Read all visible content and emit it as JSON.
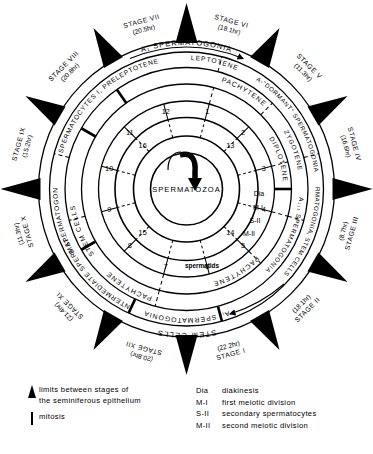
{
  "diagram": {
    "title_text": "Cycle of the seminiferous epithelium",
    "center_label": "SPERMATOZOA",
    "stages": [
      {
        "name": "STAGE I",
        "duration": "(22.2hr)"
      },
      {
        "name": "STAGE II",
        "duration": "(18.1hr)"
      },
      {
        "name": "STAGE III",
        "duration": "(8.7hr)"
      },
      {
        "name": "STAGE IV",
        "duration": "(16.6hr)"
      },
      {
        "name": "STAGE V",
        "duration": "(11.3hr)"
      },
      {
        "name": "STAGE VI",
        "duration": "(18.1hr)"
      },
      {
        "name": "STAGE VII",
        "duration": "(20.5hr)"
      },
      {
        "name": "STAGE VIII",
        "duration": "(20.8hr)"
      },
      {
        "name": "STAGE IX",
        "duration": "(15.2hr)"
      },
      {
        "name": "STAGE X",
        "duration": "(11.3hr)"
      },
      {
        "name": "STAGE XI",
        "duration": "(21.4hr)"
      },
      {
        "name": "STAGE XII",
        "duration": "(20.8hr)"
      }
    ],
    "ring_labels": {
      "outer": [
        "STEM CELLS",
        "A₁ SPERMATOGONIA"
      ],
      "second": [
        "Aᵢᵥ SPERMATOGONIA",
        "INTERMEDIATE SPERMAT.",
        "B SPERMATOGONIA",
        "SPERMATOCYTES I, PRELEPTOTENE",
        "LEPTOTENE",
        "A-\"DORMANT\" SPERMATOGONIA",
        "A₁₁ SPERMATOGONIA, STEM CELLS"
      ],
      "third": [
        "STEM CELLS",
        "PACHYTENE",
        "A₁₁₁ SPERMATOGONIA",
        "ZYGOTENE"
      ],
      "fourth": [
        "PACHYTENE",
        "DIPLOTENE",
        "Dia",
        "M-I",
        "S-II",
        "M-II",
        "spermatids"
      ]
    },
    "numbers_outer": [
      "1",
      "2",
      "3",
      "4",
      "5",
      "6",
      "7",
      "8",
      "9",
      "10",
      "11",
      "12"
    ],
    "numbers_inner": [
      "13",
      "14",
      "15",
      "16"
    ]
  },
  "legend": {
    "left": [
      {
        "mark": "triangle-marker",
        "lines": [
          "limits between stages of",
          "the seminiferous epithelium"
        ]
      },
      {
        "mark": "bar-marker",
        "lines": [
          "mitosis"
        ]
      }
    ],
    "right": [
      {
        "key": "Dia",
        "text": "diakinesis"
      },
      {
        "key": "M-I",
        "text": "first meiotic division"
      },
      {
        "key": "S-II",
        "text": "secondary spermatocytes"
      },
      {
        "key": "M-II",
        "text": "second meiotic division"
      }
    ]
  },
  "colors": {
    "ink": "#000000",
    "paper": "#ffffff"
  }
}
